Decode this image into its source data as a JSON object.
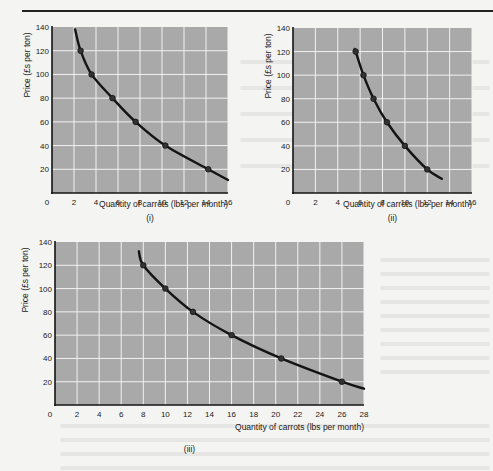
{
  "chart_data": [
    {
      "type": "line",
      "panel_label": "(i)",
      "xlabel": "Quantity of carrots (lbs per month)",
      "ylabel": "Price (£s per ton)",
      "xlim": [
        0,
        16
      ],
      "ylim": [
        0,
        140
      ],
      "xticks": [
        0,
        2,
        4,
        6,
        8,
        10,
        12,
        14,
        16
      ],
      "yticks": [
        20,
        40,
        60,
        80,
        100,
        120,
        140
      ],
      "grid": true,
      "series": [
        {
          "name": "Demand curve (i)",
          "points": [
            [
              2.6,
              120
            ],
            [
              3.6,
              100
            ],
            [
              5.5,
              80
            ],
            [
              7.6,
              60
            ],
            [
              10.3,
              40
            ],
            [
              14.2,
              20
            ]
          ],
          "curve": [
            [
              2.1,
              138
            ],
            [
              2.6,
              120
            ],
            [
              3.6,
              100
            ],
            [
              5.5,
              80
            ],
            [
              7.6,
              60
            ],
            [
              10.3,
              40
            ],
            [
              14.2,
              20
            ],
            [
              16,
              11
            ]
          ]
        }
      ]
    },
    {
      "type": "line",
      "panel_label": "(ii)",
      "xlabel": "Quantity of carrots (lbs per month)",
      "ylabel": "Price (£s per ton)",
      "xlim": [
        0,
        16
      ],
      "ylim": [
        0,
        140
      ],
      "xticks": [
        0,
        2,
        4,
        6,
        8,
        10,
        12,
        14,
        16
      ],
      "yticks": [
        20,
        40,
        60,
        80,
        100,
        120,
        140
      ],
      "grid": true,
      "series": [
        {
          "name": "Demand curve (ii)",
          "points": [
            [
              5.6,
              120
            ],
            [
              6.3,
              100
            ],
            [
              7.2,
              80
            ],
            [
              8.4,
              60
            ],
            [
              10,
              40
            ],
            [
              12,
              20
            ]
          ],
          "curve": [
            [
              5.5,
              122
            ],
            [
              5.6,
              120
            ],
            [
              6.3,
              100
            ],
            [
              7.2,
              80
            ],
            [
              8.4,
              60
            ],
            [
              10,
              40
            ],
            [
              12,
              20
            ],
            [
              13.3,
              12
            ]
          ]
        }
      ]
    },
    {
      "type": "line",
      "panel_label": "(iii)",
      "xlabel": "Quantity of carrots (lbs per month)",
      "ylabel": "Price (£s per ton)",
      "xlim": [
        0,
        28
      ],
      "ylim": [
        0,
        140
      ],
      "xticks": [
        0,
        2,
        4,
        6,
        8,
        10,
        12,
        14,
        16,
        18,
        20,
        22,
        24,
        26,
        28
      ],
      "yticks": [
        20,
        40,
        60,
        80,
        100,
        120,
        140
      ],
      "grid": true,
      "series": [
        {
          "name": "Demand curve (iii)",
          "points": [
            [
              8,
              120
            ],
            [
              10,
              100
            ],
            [
              12.5,
              80
            ],
            [
              16,
              60
            ],
            [
              20.5,
              40
            ],
            [
              26,
              20
            ]
          ],
          "curve": [
            [
              7.6,
              132
            ],
            [
              8,
              120
            ],
            [
              10,
              100
            ],
            [
              12.5,
              80
            ],
            [
              16,
              60
            ],
            [
              20.5,
              40
            ],
            [
              26,
              20
            ],
            [
              28,
              14
            ]
          ]
        }
      ]
    }
  ],
  "colors": {
    "plot_bg": "#a9a9a9",
    "grid": "#f2f2f2",
    "curve": "#141414",
    "axis": "#141414"
  }
}
